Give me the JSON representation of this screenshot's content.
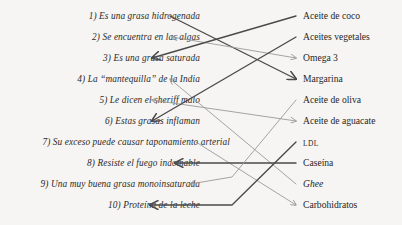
{
  "document": {
    "type": "matching-exercise",
    "language": "es",
    "background_color": "#f6f5f3"
  },
  "left_column": {
    "items": [
      {
        "number": "1)",
        "text": "1) Es una grasa hidrogenada"
      },
      {
        "number": "2)",
        "text": "2) Se encuentra en las algas"
      },
      {
        "number": "3)",
        "text": "3) Es una grasa saturada"
      },
      {
        "number": "4)",
        "text": "4) La “mantequilla” de la India"
      },
      {
        "number": "5)",
        "text": "5) Le dicen el sheriff malo"
      },
      {
        "number": "6)",
        "text": "6) Estas grasas inflaman"
      },
      {
        "number": "7)",
        "text": "7) Su exceso puede causar taponamiento arterial"
      },
      {
        "number": "8)",
        "text": "8) Resiste el fuego indomable"
      },
      {
        "number": "9)",
        "text": "9) Una muy buena grasa monoinsaturada"
      },
      {
        "number": "10)",
        "text": "10) Proteína de la leche"
      }
    ]
  },
  "right_column": {
    "items": [
      {
        "text": "Aceite de coco",
        "style": "regular"
      },
      {
        "text": "Aceites vegetales",
        "style": "regular"
      },
      {
        "text": "Omega 3",
        "style": "regular"
      },
      {
        "text": "Margarina",
        "style": "regular"
      },
      {
        "text": "Aceite de oliva",
        "style": "regular"
      },
      {
        "text": "Aceite de aguacate",
        "style": "regular"
      },
      {
        "text": "LDL",
        "style": "smallcaps"
      },
      {
        "text": "Caseína",
        "style": "regular"
      },
      {
        "text": "Ghee",
        "style": "italic"
      },
      {
        "text": "Carbohidratos",
        "style": "regular"
      }
    ]
  },
  "connectors": {
    "dark_color": "#4a4a4a",
    "light_color": "#9a9a9a",
    "dark_width": 1.35,
    "light_width": 0.9,
    "lines": [
      {
        "from": "left-1",
        "to": "right-4",
        "tone": "dark"
      },
      {
        "from": "left-2",
        "to": "right-3",
        "tone": "light"
      },
      {
        "from": "left-3",
        "to": "right-1",
        "tone": "dark"
      },
      {
        "from": "left-4",
        "to": "right-9",
        "tone": "light"
      },
      {
        "from": "left-5",
        "to": "right-6",
        "tone": "light"
      },
      {
        "from": "left-6",
        "to": "right-2",
        "tone": "dark"
      },
      {
        "from": "left-7",
        "to": "right-10",
        "tone": "light"
      },
      {
        "from": "left-8",
        "to": "right-8",
        "tone": "dark"
      },
      {
        "from": "left-9",
        "to": "right-5",
        "tone": "light"
      },
      {
        "from": "left-10",
        "to": "right-7",
        "tone": "dark"
      }
    ]
  }
}
